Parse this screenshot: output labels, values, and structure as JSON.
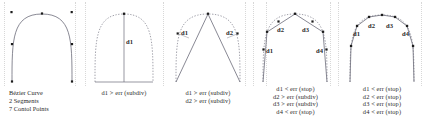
{
  "figure": {
    "background": "#ffffff",
    "curve_color": "#6b6b78",
    "dashed_color": "#8a8a96",
    "chord_color": "#5a5a66",
    "point_color": "#1c1c1c",
    "text_color": "#2b2b2b"
  },
  "panels": [
    {
      "id": "panel-original-curve",
      "kind": "original-curve",
      "legend": [
        "Bézier Curve",
        "2 Segments",
        "7 Contol Points"
      ],
      "caption": [],
      "distance_labels": []
    },
    {
      "id": "panel-level-1",
      "kind": "subdivision-level-1",
      "legend": [],
      "caption": [
        "d1 > err (subdiv)"
      ],
      "distance_labels": [
        {
          "name": "d1",
          "text": "d1"
        }
      ]
    },
    {
      "id": "panel-level-2",
      "kind": "subdivision-level-2",
      "legend": [],
      "caption": [
        "d1 > err (subdiv)",
        "d2 > err (subdiv)"
      ],
      "distance_labels": [
        {
          "name": "d1",
          "text": "d1"
        },
        {
          "name": "d2",
          "text": "d2"
        }
      ]
    },
    {
      "id": "panel-level-3",
      "kind": "subdivision-level-3",
      "legend": [],
      "caption": [
        "d1 < err (stop)",
        "d2 > err (subdiv)",
        "d3 > err (subdiv)",
        "d4 < err (stop)"
      ],
      "distance_labels": [
        {
          "name": "d1",
          "text": "d1"
        },
        {
          "name": "d2",
          "text": "d2"
        },
        {
          "name": "d3",
          "text": "d3"
        },
        {
          "name": "d4",
          "text": "d4"
        }
      ]
    },
    {
      "id": "panel-level-4",
      "kind": "subdivision-final",
      "legend": [],
      "caption": [
        "d1 < err (stop)",
        "d2 < err (stop)",
        "d3 < err (stop)",
        "d4 < err (stop)"
      ],
      "distance_labels": [
        {
          "name": "d1",
          "text": "d1"
        },
        {
          "name": "d2",
          "text": "d2"
        },
        {
          "name": "d3",
          "text": "d3"
        },
        {
          "name": "d4",
          "text": "d4"
        }
      ]
    }
  ]
}
